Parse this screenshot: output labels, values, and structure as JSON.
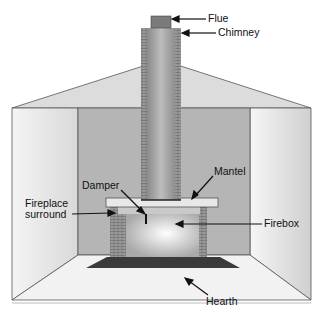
{
  "diagram": {
    "labels": {
      "flue": "Flue",
      "chimney": "Chimney",
      "damper": "Damper",
      "mantel": "Mantel",
      "surround_line1": "Fireplace",
      "surround_line2": "surround",
      "firebox": "Firebox",
      "hearth": "Hearth"
    },
    "colors": {
      "brick": "#8a8a8a",
      "hearth": "#3a3a3a",
      "back_wall": "#b8b8b8",
      "side_wall": "#e6e6e6",
      "ceiling": "#d8d8d8",
      "lines": "#444444"
    }
  }
}
